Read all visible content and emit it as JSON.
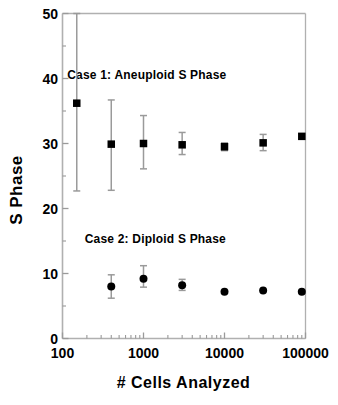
{
  "chart_data": {
    "type": "scatter",
    "title": "",
    "xlabel": "# Cells Analyzed",
    "ylabel": "S Phase",
    "xscale": "log",
    "yscale": "linear",
    "xlim": [
      100,
      100000
    ],
    "ylim": [
      0,
      50
    ],
    "grid": false,
    "legend_position": "none",
    "xticks": [
      {
        "value": 100,
        "label": "100"
      },
      {
        "value": 1000,
        "label": "1000"
      },
      {
        "value": 10000,
        "label": "10000"
      },
      {
        "value": 100000,
        "label": "100000"
      }
    ],
    "yticks": [
      {
        "value": 0,
        "label": "0"
      },
      {
        "value": 10,
        "label": "10"
      },
      {
        "value": 20,
        "label": "20"
      },
      {
        "value": 30,
        "label": "30"
      },
      {
        "value": 40,
        "label": "40"
      },
      {
        "value": 50,
        "label": "50"
      }
    ],
    "annotations": [
      {
        "text": "Case 1:  Aneuploid S Phase",
        "x": 1100,
        "y": 40.5
      },
      {
        "text": "Case 2:  Diploid S Phase",
        "x": 1400,
        "y": 15.3
      }
    ],
    "series": [
      {
        "name": "Case 1: Aneuploid S Phase",
        "marker": "square",
        "color": "#000000",
        "errorbar_color": "#9a9a9a",
        "points": [
          {
            "x": 150,
            "y": 36.2,
            "yerr_low": 22.7,
            "yerr_high": 50.0
          },
          {
            "x": 400,
            "y": 29.9,
            "yerr_low": 22.8,
            "yerr_high": 36.7
          },
          {
            "x": 1000,
            "y": 30.0,
            "yerr_low": 26.1,
            "yerr_high": 34.3
          },
          {
            "x": 3000,
            "y": 29.8,
            "yerr_low": 28.3,
            "yerr_high": 31.7
          },
          {
            "x": 10000,
            "y": 29.5,
            "yerr_low": 28.9,
            "yerr_high": 30.1
          },
          {
            "x": 30000,
            "y": 30.1,
            "yerr_low": 28.9,
            "yerr_high": 31.4
          },
          {
            "x": 90000,
            "y": 31.1,
            "yerr_low": 31.1,
            "yerr_high": 31.1
          }
        ]
      },
      {
        "name": "Case 2: Diploid S Phase",
        "marker": "circle",
        "color": "#000000",
        "errorbar_color": "#9a9a9a",
        "points": [
          {
            "x": 400,
            "y": 8.0,
            "yerr_low": 6.2,
            "yerr_high": 9.8
          },
          {
            "x": 1000,
            "y": 9.2,
            "yerr_low": 7.9,
            "yerr_high": 11.2
          },
          {
            "x": 3000,
            "y": 8.2,
            "yerr_low": 7.4,
            "yerr_high": 9.1
          },
          {
            "x": 10000,
            "y": 7.2,
            "yerr_low": 7.2,
            "yerr_high": 7.2
          },
          {
            "x": 30000,
            "y": 7.4,
            "yerr_low": 7.4,
            "yerr_high": 7.4
          },
          {
            "x": 90000,
            "y": 7.2,
            "yerr_low": 7.2,
            "yerr_high": 7.2
          }
        ]
      }
    ]
  },
  "axes": {
    "frame_color": "#b0b0b0",
    "tick_color": "#9a9a9a"
  }
}
